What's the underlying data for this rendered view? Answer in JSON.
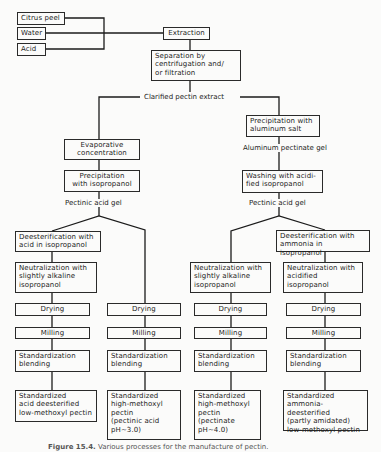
{
  "diagram": {
    "inputs": [
      {
        "id": "citrus-peel",
        "label": "Citrus peel"
      },
      {
        "id": "water",
        "label": "Water"
      },
      {
        "id": "acid",
        "label": "Acid"
      }
    ],
    "top_steps": {
      "extraction": "Extraction",
      "separation": "Separation by\ncentrifugation and/\nor filtration",
      "clarified": "Clarified pectin extract"
    },
    "left_branch": {
      "evaporative": "Evaporative\nconcentration",
      "precipitation": "Precipitation\nwith isopropanol",
      "gel": "Pectinic acid gel"
    },
    "right_branch": {
      "precipitation": "Precipitation with\naluminum salt",
      "aluminum_gel": "Aluminum pectinate gel",
      "washing": "Washing with acidi-\nfied isopropanol",
      "gel": "Pectinic acid gel"
    },
    "columns": [
      {
        "deesterification": "Deesterification with\nacid in isopropanol",
        "neutralization": "Neutralization with\nslightly alkaline\nisopropanol",
        "drying": "Drying",
        "milling": "Milling",
        "standardization": "Standardization\nblending",
        "product": "Standardized\nacid deesterified\nlow-methoxyl pectin"
      },
      {
        "drying": "Drying",
        "milling": "Milling",
        "standardization": "Standardization\nblending",
        "product": "Standardized\nhigh-methoxyl\npectin\n(pectinic acid\n    pH~3.0)"
      },
      {
        "neutralization": "Neutralization with\nslightly alkaline\nisopropanol",
        "drying": "Drying",
        "milling": "Milling",
        "standardization": "Standardization\nblending",
        "product": "Standardized\nhigh-methoxyl\npectin\n(pectinate\n    pH~4.0)"
      },
      {
        "deesterification": "Deesterification with\nammonia in isopropanol",
        "neutralization": "Neutralization with\nacidified\nisopropanol",
        "drying": "Drying",
        "milling": "Milling",
        "standardization": "Standardization\nblending",
        "product": "Standardized\nammonia-deesterified\n(partly amidated)\nlow-methoxyl pectin"
      }
    ],
    "caption": {
      "figure": "Figure 15.4.",
      "text": "Various processes for the manufacture of pectin."
    },
    "colors": {
      "line": "#1b1b1b",
      "background": "#fbfbfa"
    }
  }
}
